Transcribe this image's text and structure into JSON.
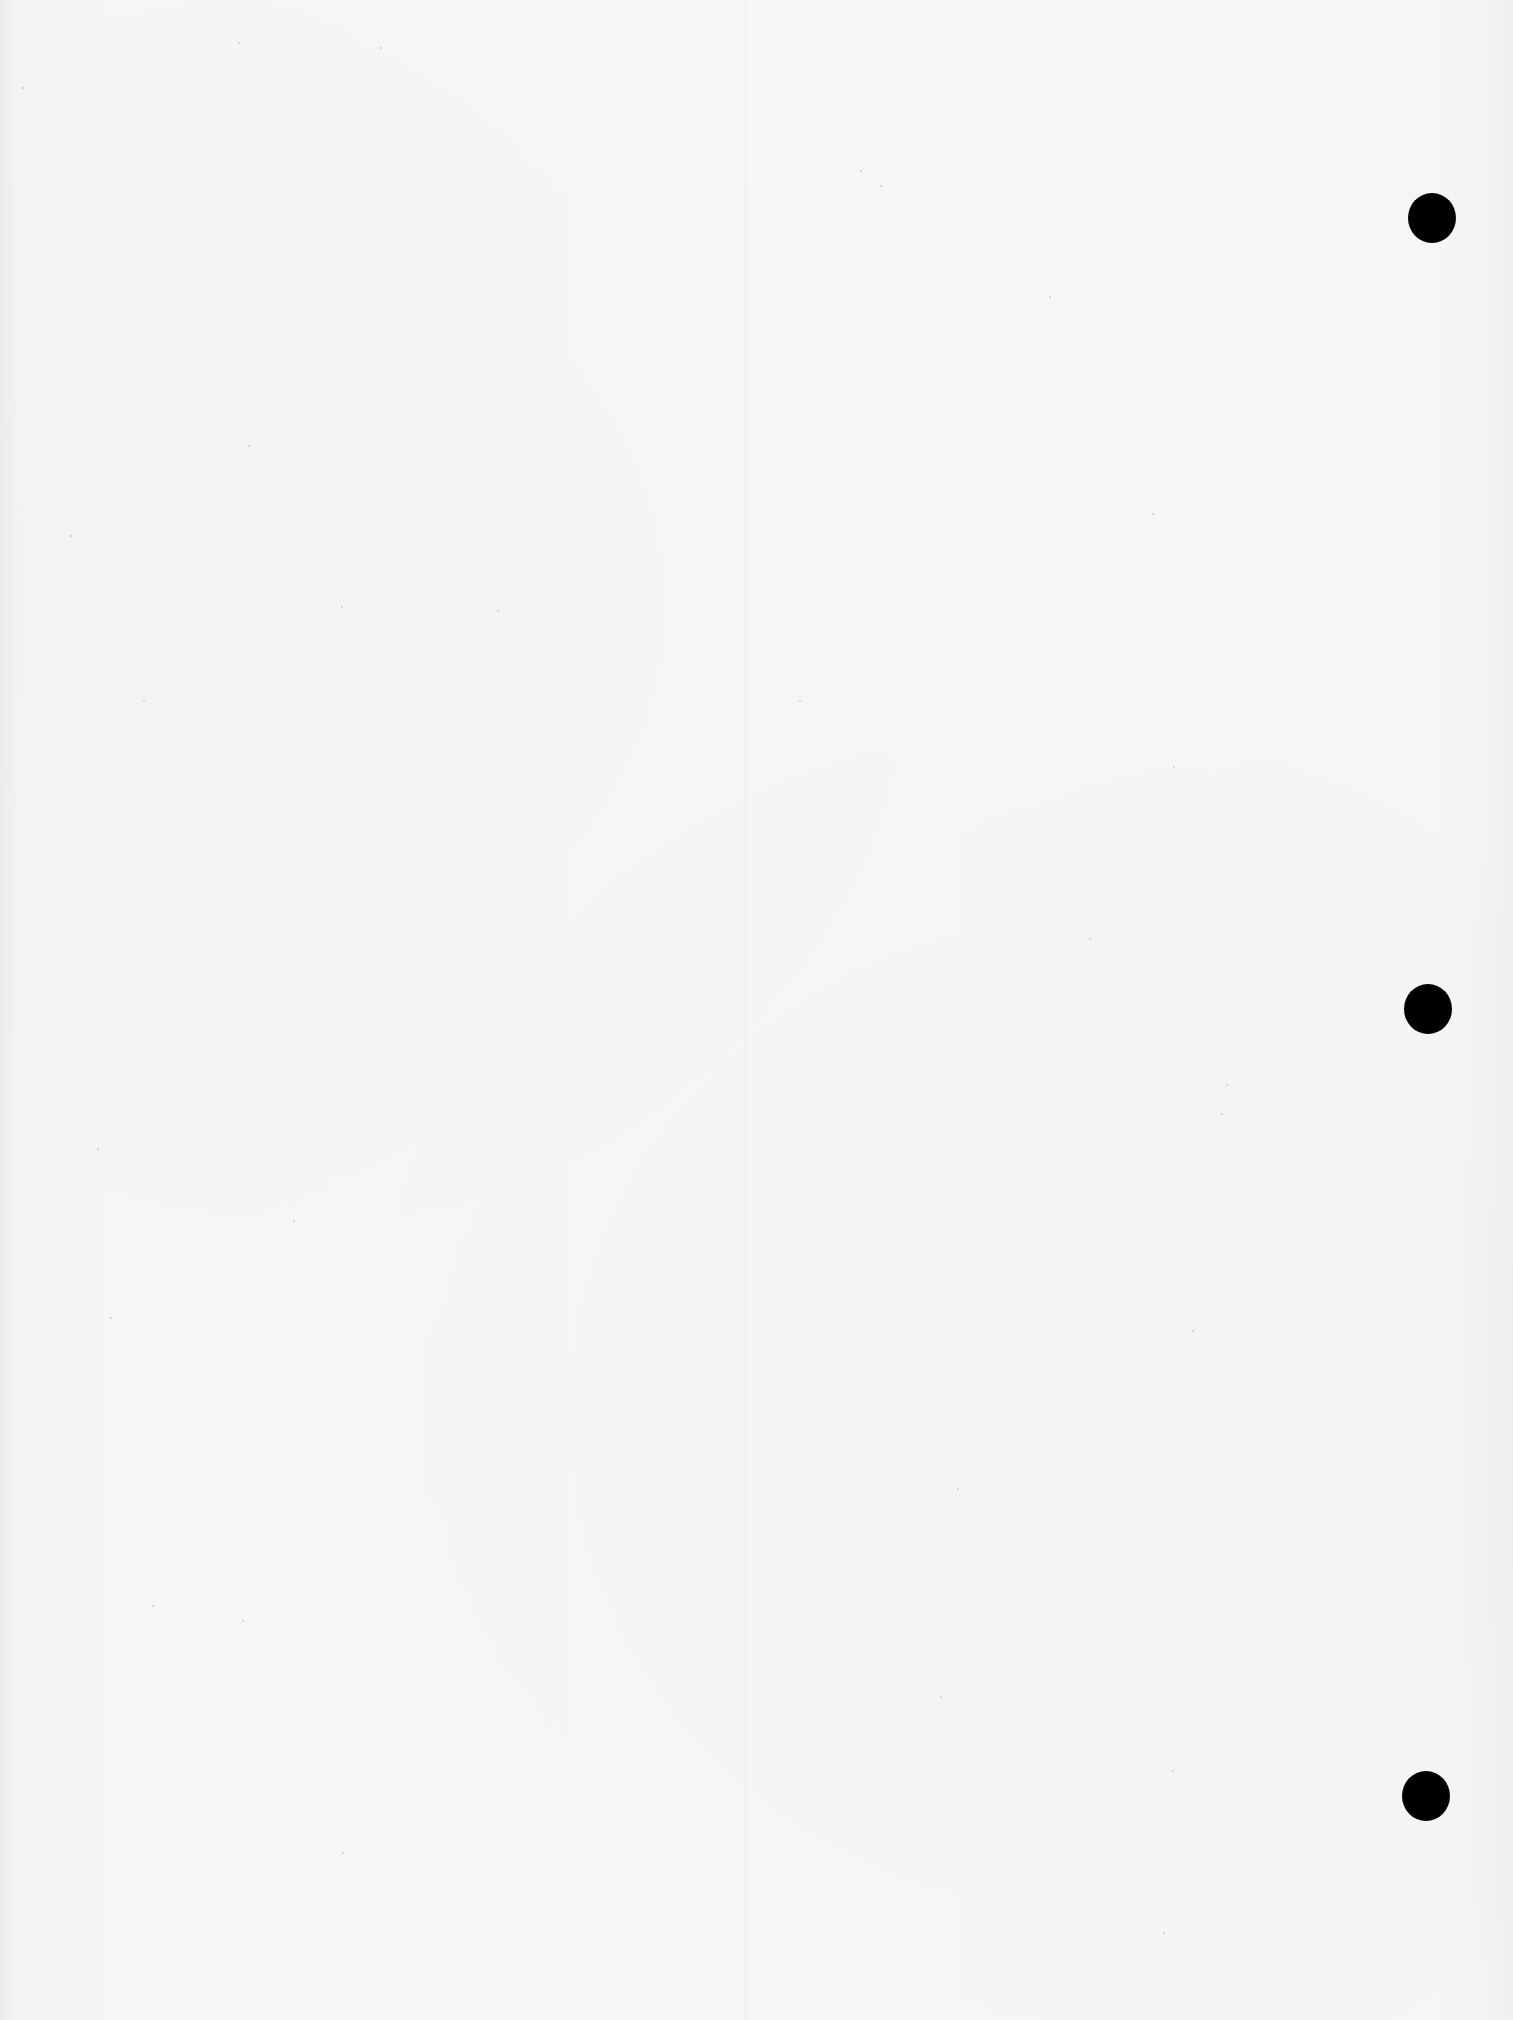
{
  "page": {
    "type": "blank-hole-punched-sheet",
    "background_color": "#f6f6f6",
    "text_content": "",
    "fold_line": {
      "x": 745,
      "color": "#ffffff"
    },
    "punch_holes": [
      {
        "cx": 1432,
        "cy": 217,
        "diameter": 48,
        "color": "#000000"
      },
      {
        "cx": 1428,
        "cy": 1008,
        "diameter": 48,
        "color": "#000000"
      },
      {
        "cx": 1426,
        "cy": 1795,
        "diameter": 48,
        "color": "#000000"
      }
    ]
  }
}
